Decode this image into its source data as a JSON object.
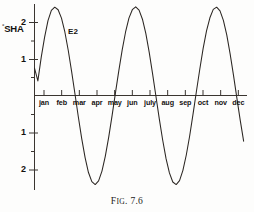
{
  "figure": {
    "caption_prefix": "F",
    "caption_smallcaps": "IG",
    "caption_suffix": ". 7.6",
    "caption_full": "FIG. 7.6"
  },
  "axes": {
    "y_title": "SHA",
    "y_title_degree": "°",
    "y_ticks": [
      {
        "label": "2",
        "value": 2
      },
      {
        "label": "",
        "value": 1.5
      },
      {
        "label": "1",
        "value": 1
      },
      {
        "label": "",
        "value": 0.5
      },
      {
        "label": "",
        "value": -0.5
      },
      {
        "label": "1",
        "value": -1
      },
      {
        "label": "",
        "value": -1.5
      },
      {
        "label": "2",
        "value": -2
      }
    ],
    "x_ticks": [
      "jan",
      "feb",
      "mar",
      "apr",
      "may",
      "jun",
      "july",
      "aug",
      "sep",
      "oct",
      "nov",
      "dec"
    ]
  },
  "annotations": [
    {
      "text": "E2",
      "x_month": "mar",
      "y_value": 1.75
    }
  ],
  "style": {
    "line_color": "#2b2622",
    "axis_color": "#3a3530",
    "background": "#fdfdfc"
  },
  "chart_data": {
    "type": "line",
    "title": "FIG. 7.6",
    "xlabel": "",
    "ylabel": "°SHA",
    "grid": false,
    "legend": "none",
    "xlim": [
      0,
      12.6
    ],
    "ylim": [
      -2.6,
      2.6
    ],
    "categories": [
      "jan",
      "feb",
      "mar",
      "apr",
      "may",
      "jun",
      "july",
      "aug",
      "sep",
      "oct",
      "nov",
      "dec"
    ],
    "series": [
      {
        "name": "E2",
        "x": [
          0.0,
          0.2,
          0.4,
          0.6,
          0.8,
          1.0,
          1.2,
          1.4,
          1.6,
          1.8,
          2.0,
          2.2,
          2.4,
          2.6,
          2.8,
          3.0,
          3.2,
          3.4,
          3.6,
          3.8,
          4.0,
          4.2,
          4.4,
          4.6,
          4.8,
          5.0,
          5.2,
          5.4,
          5.6,
          5.8,
          6.0,
          6.2,
          6.4,
          6.6,
          6.8,
          7.0,
          7.2,
          7.4,
          7.6,
          7.8,
          8.0,
          8.2,
          8.4,
          8.6,
          8.8,
          9.0,
          9.2,
          9.4,
          9.6,
          9.8,
          10.0,
          10.2,
          10.4,
          10.6,
          10.8,
          11.0,
          11.2,
          11.4,
          11.6,
          11.8,
          12.0,
          12.2,
          12.4
        ],
        "y": [
          0.75,
          0.4,
          1.05,
          1.6,
          2.05,
          2.33,
          2.42,
          2.35,
          2.12,
          1.74,
          1.24,
          0.66,
          0.04,
          -0.59,
          -1.18,
          -1.7,
          -2.11,
          -2.36,
          -2.44,
          -2.34,
          -2.07,
          -1.66,
          -1.14,
          -0.55,
          0.07,
          0.68,
          1.25,
          1.74,
          2.12,
          2.35,
          2.43,
          2.34,
          2.09,
          1.7,
          1.19,
          0.6,
          -0.02,
          -0.64,
          -1.22,
          -1.73,
          -2.12,
          -2.37,
          -2.44,
          -2.33,
          -2.05,
          -1.63,
          -1.11,
          -0.51,
          0.11,
          0.72,
          1.29,
          1.77,
          2.13,
          2.36,
          2.42,
          2.32,
          2.06,
          1.66,
          1.14,
          0.55,
          -0.07,
          -0.68,
          -1.25
        ]
      }
    ]
  }
}
